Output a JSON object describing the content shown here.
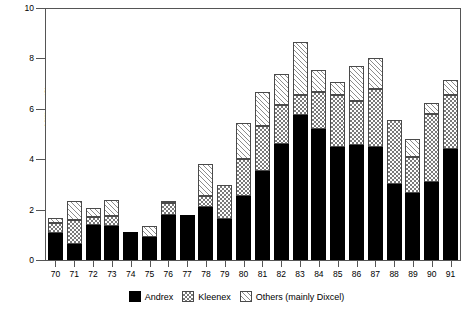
{
  "chart_data": {
    "type": "bar",
    "stacked": true,
    "title": "",
    "subtitle": "",
    "xlabel": "",
    "ylabel": "Millions (£)",
    "ylim": [
      0,
      10
    ],
    "yticks": [
      0,
      2,
      4,
      6,
      8,
      10
    ],
    "ytick_labels": [
      "0",
      "2",
      "4",
      "6",
      "8",
      "10"
    ],
    "grid": false,
    "legend_position": "bottom-center",
    "categories": [
      "70",
      "71",
      "72",
      "73",
      "74",
      "75",
      "76",
      "77",
      "78",
      "79",
      "80",
      "81",
      "82",
      "83",
      "84",
      "85",
      "86",
      "87",
      "88",
      "89",
      "90",
      "91"
    ],
    "series": [
      {
        "name": "Andrex",
        "fill": "solid-black",
        "color": "#000000",
        "values": [
          1.08,
          0.62,
          1.4,
          1.33,
          1.1,
          0.9,
          1.8,
          1.8,
          2.1,
          1.63,
          2.55,
          3.55,
          4.6,
          5.75,
          5.2,
          4.5,
          4.55,
          4.5,
          3.0,
          2.65,
          3.1,
          4.4
        ]
      },
      {
        "name": "Kleenex",
        "fill": "checkered",
        "color": "#7a7a7a",
        "values": [
          0.37,
          0.95,
          0.3,
          0.4,
          0.0,
          0.0,
          0.45,
          0.0,
          0.45,
          1.35,
          1.45,
          1.75,
          1.55,
          0.8,
          1.45,
          2.05,
          1.75,
          2.3,
          2.55,
          1.45,
          2.7,
          2.15
        ]
      },
      {
        "name": "Others (mainly Dixcel)",
        "fill": "diagonal-hatch",
        "color": "#8c8c8c",
        "values": [
          0.2,
          0.78,
          0.38,
          0.65,
          0.0,
          0.45,
          0.1,
          0.0,
          1.25,
          0.0,
          1.45,
          1.35,
          1.25,
          2.1,
          0.9,
          0.5,
          1.4,
          1.2,
          0.0,
          0.7,
          0.45,
          0.6
        ]
      }
    ],
    "totals": [
      1.65,
      2.35,
      2.08,
      2.38,
      1.1,
      1.35,
      2.35,
      1.8,
      3.8,
      2.98,
      5.45,
      6.65,
      7.4,
      8.65,
      7.55,
      7.05,
      7.7,
      8.0,
      5.55,
      4.8,
      6.25,
      7.15
    ]
  },
  "legend": {
    "items": [
      {
        "label": "Andrex"
      },
      {
        "label": "Kleenex"
      },
      {
        "label": "Others (mainly Dixcel)"
      }
    ]
  }
}
